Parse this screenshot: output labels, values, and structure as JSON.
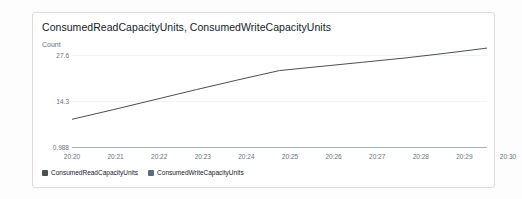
{
  "widget": {
    "title": "ConsumedReadCapacityUnits, ConsumedWriteCapacityUnits",
    "y_axis_title": "Count"
  },
  "legend": {
    "items": [
      {
        "label": "ConsumedReadCapacityUnits",
        "color": "#4a4f55"
      },
      {
        "label": "ConsumedWriteCapacityUnits",
        "color": "#5f6b7a"
      }
    ]
  },
  "chart_data": {
    "type": "line",
    "title": "ConsumedReadCapacityUnits, ConsumedWriteCapacityUnits",
    "xlabel": "",
    "ylabel": "Count",
    "grid": true,
    "legend_position": "bottom-left",
    "x": [
      "20:20",
      "20:21",
      "20:22",
      "20:23",
      "20:24",
      "20:25",
      "20:26",
      "20:27",
      "20:28",
      "20:29",
      "20:30"
    ],
    "ytick_labels": [
      "27.6",
      "14.3",
      "0.988"
    ],
    "ytick_values": [
      27.6,
      14.3,
      0.988
    ],
    "ylim": [
      0.988,
      27.6
    ],
    "series": [
      {
        "name": "ConsumedReadCapacityUnits",
        "color": "#4a4f55",
        "values": [
          9.0,
          11.8,
          14.7,
          17.6,
          20.4,
          23.1,
          24.3,
          25.5,
          26.7,
          28.1,
          29.6
        ]
      },
      {
        "name": "ConsumedWriteCapacityUnits",
        "color": "#5f6b7a",
        "values": [
          0.988,
          0.988,
          0.988,
          0.988,
          0.988,
          0.988,
          0.988,
          0.988,
          0.988,
          0.988,
          0.988
        ]
      }
    ]
  }
}
